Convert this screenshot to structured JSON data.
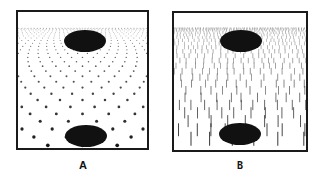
{
  "figure": {
    "panels": [
      {
        "id": "A",
        "label": "A",
        "texture": "dots",
        "description": "Perspective texture gradient of dots receding toward horizon with two dark ellipses"
      },
      {
        "id": "B",
        "label": "B",
        "texture": "vertical-lines",
        "description": "Perspective texture gradient of vertical line segments receding toward horizon with two dark ellipses"
      }
    ],
    "colors": {
      "ink": "#111111",
      "frame": "#1a1a1a",
      "background": "#ffffff"
    }
  }
}
